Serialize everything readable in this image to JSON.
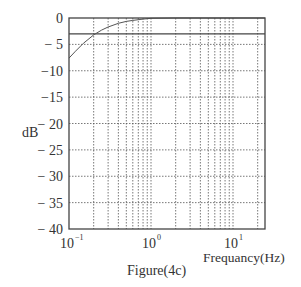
{
  "chart_data": {
    "type": "line",
    "title": "",
    "caption": "Figure(4c)",
    "xlabel": "Frequancy(Hz)",
    "ylabel": "dB",
    "xscale": "log",
    "xlim": [
      0.1,
      28
    ],
    "ylim": [
      -40,
      0
    ],
    "x_ticks": [
      {
        "value": 0.1,
        "base": "10",
        "exp": "−1"
      },
      {
        "value": 1,
        "base": "10",
        "exp": "0"
      },
      {
        "value": 10,
        "base": "10",
        "exp": "1"
      }
    ],
    "y_ticks": [
      0,
      -5,
      -10,
      -15,
      -20,
      -25,
      -30,
      -35,
      -40
    ],
    "y_tick_labels": [
      "0",
      "− 5",
      "−10",
      "−15",
      "− 20",
      "− 25",
      "− 30",
      "− 35",
      "− 40"
    ],
    "grid": {
      "x": "log-minor dotted",
      "y": "dotted"
    },
    "reference_line": {
      "y": -3,
      "style": "solid"
    },
    "series": [
      {
        "name": "magnitude response",
        "x": [
          0.1,
          0.12,
          0.15,
          0.2,
          0.25,
          0.3,
          0.4,
          0.5,
          0.6,
          0.8,
          1.0,
          2,
          5,
          10,
          28
        ],
        "y": [
          -7.6,
          -6.3,
          -4.8,
          -3.2,
          -2.3,
          -1.7,
          -1.0,
          -0.65,
          -0.45,
          -0.2,
          -0.05,
          0,
          0,
          0,
          0
        ]
      }
    ],
    "colors": {
      "axis": "#444444",
      "grid": "#555555",
      "curve": "#555555",
      "text": "#333333"
    }
  }
}
